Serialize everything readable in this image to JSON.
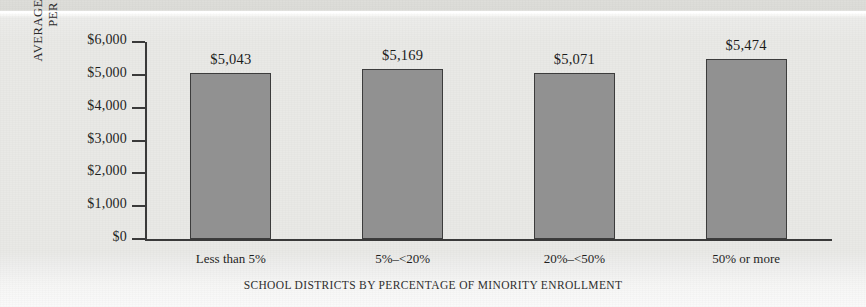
{
  "chart_data": {
    "type": "bar",
    "title": "",
    "xlabel": "SCHOOL DISTRICTS BY PERCENTAGE OF MINORITY ENROLLMENT",
    "ylabel_lines": [
      "AVERAGE EXPENDITURE",
      "PER STUDENT"
    ],
    "categories": [
      "Less than 5%",
      "5%–<20%",
      "20%–<50%",
      "50% or more"
    ],
    "values": [
      5043,
      5169,
      5071,
      5474
    ],
    "value_labels": [
      "$5,043",
      "$5,169",
      "$5,071",
      "$5,474"
    ],
    "ylim": [
      0,
      6000
    ],
    "ytick_values": [
      0,
      1000,
      2000,
      3000,
      4000,
      5000,
      6000
    ],
    "ytick_labels": [
      "$0",
      "$1,000",
      "$2,000",
      "$3,000",
      "$4,000",
      "$5,000",
      "$6,000"
    ],
    "grid": false,
    "legend": null,
    "bar_color": "#919191",
    "bar_border_color": "#3c3c3c",
    "axis_color": "#3a3a3a",
    "background_color": "#e9e9e6",
    "text_color": "#1f1f1f"
  }
}
